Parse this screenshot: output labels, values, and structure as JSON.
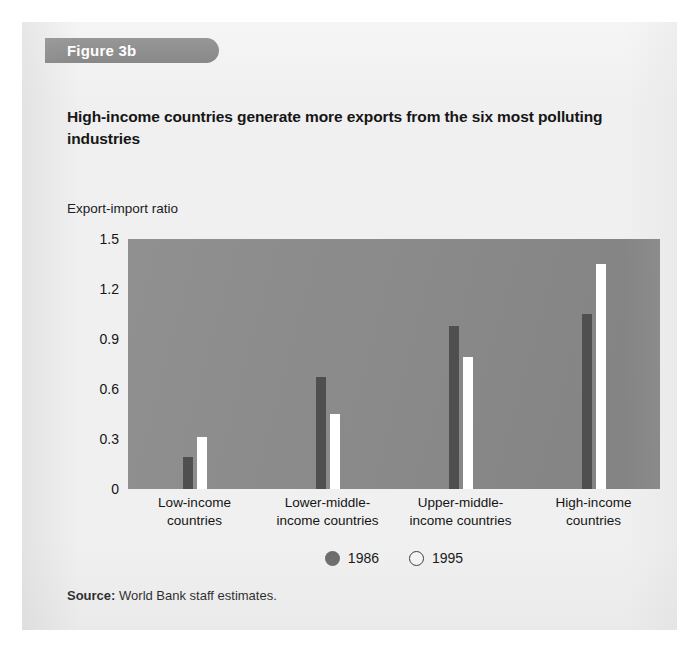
{
  "figure": {
    "tab_label": "Figure 3b",
    "title": "High-income countries generate more exports from the six most polluting industries",
    "source_prefix": "Source:",
    "source_text": "World Bank staff estimates."
  },
  "colors": {
    "tab_background": "#6e6e6e",
    "plot_background": "#8a8a8a",
    "card_background": "#f0f0f0",
    "series_1986": "#4f4f4f",
    "series_1995": "#ffffff",
    "text": "#141414"
  },
  "chart_data": {
    "type": "bar",
    "title": "High-income countries generate more exports from the six most polluting industries",
    "xlabel": "",
    "ylabel": "Export-import ratio",
    "ylim": [
      0,
      1.5
    ],
    "yticks": [
      "1.5",
      "1.2",
      "0.9",
      "0.6",
      "0.3",
      "0"
    ],
    "ytick_values": [
      1.5,
      1.2,
      0.9,
      0.6,
      0.3,
      0
    ],
    "grid": false,
    "legend_position": "bottom-center",
    "categories": [
      "Low-income countries",
      "Lower-middle-income countries",
      "Upper-middle-income countries",
      "High-income countries"
    ],
    "category_lines": [
      [
        "Low-income",
        "countries"
      ],
      [
        "Lower-middle-",
        "income countries"
      ],
      [
        "Upper-middle-",
        "income countries"
      ],
      [
        "High-income",
        "countries"
      ]
    ],
    "series": [
      {
        "name": "1986",
        "color": "#4f4f4f",
        "marker": "filled-circle",
        "values": [
          0.19,
          0.67,
          0.98,
          1.05
        ]
      },
      {
        "name": "1995",
        "color": "#ffffff",
        "marker": "hollow-circle",
        "values": [
          0.31,
          0.45,
          0.79,
          1.35
        ]
      }
    ]
  }
}
